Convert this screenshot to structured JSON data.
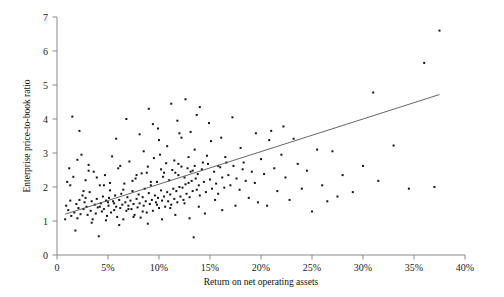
{
  "chart_data": {
    "type": "scatter",
    "title": "",
    "xlabel": "Return on net operating assets",
    "ylabel": "Enterprise price-to-book ratio",
    "xlim": [
      0,
      40
    ],
    "ylim": [
      0,
      7
    ],
    "grid": false,
    "legend": null,
    "xtick_labels": [
      "0",
      "5%",
      "10%",
      "15%",
      "20%",
      "25%",
      "30%",
      "35%",
      "40%"
    ],
    "xtick_values": [
      0,
      5,
      10,
      15,
      20,
      25,
      30,
      35,
      40
    ],
    "ytick_labels": [
      "0",
      "1",
      "2",
      "3",
      "4",
      "5",
      "6",
      "7"
    ],
    "ytick_values": [
      0,
      1,
      2,
      3,
      4,
      5,
      6,
      7
    ],
    "trendline": {
      "x0": 0.8,
      "y0": 1.2,
      "x1": 37.5,
      "y1": 4.72
    },
    "points": [
      [
        0.8,
        1.05
      ],
      [
        0.9,
        1.45
      ],
      [
        1.0,
        2.15
      ],
      [
        1.1,
        1.32
      ],
      [
        1.2,
        2.55
      ],
      [
        1.3,
        1.6
      ],
      [
        1.4,
        1.15
      ],
      [
        1.5,
        4.07
      ],
      [
        1.6,
        2.3
      ],
      [
        1.7,
        1.25
      ],
      [
        1.8,
        0.72
      ],
      [
        1.9,
        1.5
      ],
      [
        2.0,
        2.8
      ],
      [
        2.1,
        1.38
      ],
      [
        2.2,
        1.62
      ],
      [
        2.3,
        1.2
      ],
      [
        2.4,
        2.95
      ],
      [
        2.5,
        1.75
      ],
      [
        2.6,
        1.35
      ],
      [
        2.7,
        1.55
      ],
      [
        2.8,
        2.2
      ],
      [
        2.9,
        1.42
      ],
      [
        3.0,
        1.18
      ],
      [
        3.1,
        2.65
      ],
      [
        3.2,
        1.85
      ],
      [
        3.3,
        1.3
      ],
      [
        3.4,
        1.58
      ],
      [
        3.5,
        1.05
      ],
      [
        3.6,
        2.45
      ],
      [
        3.7,
        1.48
      ],
      [
        3.8,
        1.22
      ],
      [
        3.9,
        1.65
      ],
      [
        4.0,
        1.4
      ],
      [
        4.1,
        0.55
      ],
      [
        4.2,
        2.05
      ],
      [
        4.3,
        1.52
      ],
      [
        4.4,
        1.28
      ],
      [
        4.5,
        1.72
      ],
      [
        4.6,
        1.35
      ],
      [
        4.7,
        2.35
      ],
      [
        4.8,
        1.6
      ],
      [
        4.9,
        1.15
      ],
      [
        5.0,
        1.55
      ],
      [
        5.05,
        1.45
      ],
      [
        5.1,
        1.68
      ],
      [
        5.2,
        1.9
      ],
      [
        5.3,
        1.25
      ],
      [
        5.4,
        2.9
      ],
      [
        5.5,
        1.58
      ],
      [
        5.6,
        1.32
      ],
      [
        5.7,
        1.75
      ],
      [
        5.8,
        1.42
      ],
      [
        5.9,
        1.12
      ],
      [
        6.0,
        2.55
      ],
      [
        6.1,
        1.62
      ],
      [
        6.2,
        1.38
      ],
      [
        6.3,
        1.8
      ],
      [
        6.4,
        1.48
      ],
      [
        6.5,
        1.05
      ],
      [
        6.6,
        2.1
      ],
      [
        6.7,
        1.55
      ],
      [
        6.8,
        1.3
      ],
      [
        6.9,
        1.7
      ],
      [
        7.0,
        1.45
      ],
      [
        7.1,
        2.75
      ],
      [
        7.2,
        1.6
      ],
      [
        7.3,
        1.35
      ],
      [
        7.4,
        1.88
      ],
      [
        7.5,
        1.5
      ],
      [
        7.6,
        1.18
      ],
      [
        7.7,
        2.25
      ],
      [
        7.8,
        1.65
      ],
      [
        7.9,
        1.4
      ],
      [
        8.0,
        1.78
      ],
      [
        8.1,
        1.52
      ],
      [
        8.2,
        1.1
      ],
      [
        8.3,
        2.4
      ],
      [
        8.4,
        1.7
      ],
      [
        8.5,
        1.45
      ],
      [
        8.6,
        1.95
      ],
      [
        8.7,
        1.58
      ],
      [
        8.8,
        1.25
      ],
      [
        8.9,
        2.6
      ],
      [
        9.0,
        1.82
      ],
      [
        9.1,
        1.5
      ],
      [
        9.2,
        2.05
      ],
      [
        9.3,
        1.62
      ],
      [
        9.4,
        1.3
      ],
      [
        9.5,
        2.85
      ],
      [
        9.6,
        1.75
      ],
      [
        9.7,
        1.55
      ],
      [
        9.8,
        2.15
      ],
      [
        9.9,
        1.68
      ],
      [
        10.0,
        1.38
      ],
      [
        10.1,
        2.95
      ],
      [
        10.2,
        1.9
      ],
      [
        10.3,
        1.6
      ],
      [
        10.4,
        2.3
      ],
      [
        10.5,
        1.72
      ],
      [
        10.6,
        1.42
      ],
      [
        10.7,
        2.7
      ],
      [
        10.8,
        1.85
      ],
      [
        10.9,
        1.58
      ],
      [
        11.0,
        2.2
      ],
      [
        11.1,
        1.78
      ],
      [
        11.2,
        1.48
      ],
      [
        11.3,
        2.5
      ],
      [
        11.4,
        1.95
      ],
      [
        11.5,
        1.65
      ],
      [
        11.6,
        2.42
      ],
      [
        11.7,
        1.88
      ],
      [
        11.8,
        1.55
      ],
      [
        11.9,
        2.35
      ],
      [
        12.0,
        2.0
      ],
      [
        12.1,
        1.72
      ],
      [
        12.2,
        2.6
      ],
      [
        12.3,
        1.98
      ],
      [
        12.4,
        1.62
      ],
      [
        12.5,
        2.28
      ],
      [
        12.6,
        2.08
      ],
      [
        12.7,
        1.8
      ],
      [
        12.8,
        2.55
      ],
      [
        12.9,
        2.12
      ],
      [
        13.0,
        1.7
      ],
      [
        13.1,
        2.45
      ],
      [
        13.2,
        2.18
      ],
      [
        13.3,
        1.88
      ],
      [
        13.4,
        0.52
      ],
      [
        13.5,
        2.62
      ],
      [
        13.6,
        2.25
      ],
      [
        13.7,
        1.92
      ],
      [
        13.8,
        2.38
      ],
      [
        13.9,
        2.05
      ],
      [
        14.0,
        1.75
      ],
      [
        14.2,
        2.52
      ],
      [
        14.4,
        2.15
      ],
      [
        14.6,
        1.85
      ],
      [
        14.8,
        2.68
      ],
      [
        15.0,
        2.22
      ],
      [
        15.2,
        1.95
      ],
      [
        15.4,
        2.45
      ],
      [
        15.6,
        2.1
      ],
      [
        15.8,
        1.8
      ],
      [
        16.0,
        2.58
      ],
      [
        16.2,
        2.28
      ],
      [
        16.4,
        1.98
      ],
      [
        16.6,
        2.72
      ],
      [
        16.8,
        2.35
      ],
      [
        17.0,
        2.05
      ],
      [
        17.3,
        2.62
      ],
      [
        17.6,
        2.25
      ],
      [
        17.9,
        1.92
      ],
      [
        18.2,
        2.52
      ],
      [
        18.5,
        2.18
      ],
      [
        18.8,
        1.68
      ],
      [
        19.1,
        2.45
      ],
      [
        19.4,
        2.12
      ],
      [
        19.7,
        1.55
      ],
      [
        20.0,
        2.82
      ],
      [
        20.3,
        2.38
      ],
      [
        20.6,
        1.45
      ],
      [
        21.0,
        3.65
      ],
      [
        21.3,
        2.55
      ],
      [
        21.6,
        1.88
      ],
      [
        22.0,
        2.95
      ],
      [
        22.4,
        2.28
      ],
      [
        22.8,
        1.62
      ],
      [
        23.2,
        3.42
      ],
      [
        23.6,
        2.68
      ],
      [
        24.0,
        1.95
      ],
      [
        24.5,
        2.48
      ],
      [
        25.0,
        1.28
      ],
      [
        25.5,
        3.1
      ],
      [
        26.0,
        2.05
      ],
      [
        26.5,
        1.58
      ],
      [
        27.0,
        3.05
      ],
      [
        27.5,
        1.72
      ],
      [
        28.0,
        2.35
      ],
      [
        29.0,
        1.85
      ],
      [
        30.0,
        2.62
      ],
      [
        31.0,
        4.78
      ],
      [
        31.5,
        2.18
      ],
      [
        33.0,
        3.22
      ],
      [
        34.5,
        1.95
      ],
      [
        36.0,
        5.65
      ],
      [
        37.0,
        2.0
      ],
      [
        37.5,
        6.6
      ],
      [
        2.2,
        3.65
      ],
      [
        3.1,
        2.48
      ],
      [
        4.6,
        2.05
      ],
      [
        5.8,
        3.42
      ],
      [
        6.2,
        2.62
      ],
      [
        7.4,
        2.18
      ],
      [
        8.1,
        3.55
      ],
      [
        8.8,
        2.42
      ],
      [
        9.4,
        3.85
      ],
      [
        10.2,
        2.52
      ],
      [
        10.8,
        3.2
      ],
      [
        11.5,
        2.78
      ],
      [
        12.2,
        3.45
      ],
      [
        12.9,
        2.88
      ],
      [
        13.5,
        3.1
      ],
      [
        14.3,
        2.72
      ],
      [
        15.1,
        3.35
      ],
      [
        6.8,
        4.0
      ],
      [
        9.0,
        4.3
      ],
      [
        9.9,
        3.72
      ],
      [
        11.2,
        4.45
      ],
      [
        11.8,
        3.95
      ],
      [
        12.6,
        4.58
      ],
      [
        13.1,
        3.62
      ],
      [
        14.0,
        4.35
      ],
      [
        14.9,
        3.88
      ],
      [
        16.1,
        3.45
      ],
      [
        17.2,
        4.05
      ],
      [
        18.0,
        3.15
      ],
      [
        19.5,
        3.58
      ],
      [
        20.8,
        3.38
      ],
      [
        22.2,
        3.78
      ],
      [
        1.3,
        2.05
      ],
      [
        2.6,
        1.88
      ],
      [
        3.9,
        2.28
      ],
      [
        5.2,
        2.12
      ],
      [
        6.5,
        1.92
      ],
      [
        7.8,
        2.35
      ],
      [
        9.2,
        2.15
      ],
      [
        10.5,
        2.42
      ],
      [
        11.9,
        2.68
      ],
      [
        13.3,
        2.48
      ],
      [
        14.7,
        2.92
      ],
      [
        16.5,
        2.88
      ],
      [
        18.3,
        2.72
      ],
      [
        2.0,
        1.08
      ],
      [
        3.4,
        0.95
      ],
      [
        4.8,
        1.02
      ],
      [
        6.1,
        0.88
      ],
      [
        7.5,
        1.12
      ],
      [
        8.9,
        0.92
      ],
      [
        10.3,
        1.05
      ],
      [
        11.6,
        1.18
      ],
      [
        13.0,
        1.08
      ],
      [
        14.5,
        1.22
      ],
      [
        16.2,
        1.32
      ],
      [
        2.8,
        1.68
      ],
      [
        4.2,
        1.42
      ],
      [
        5.6,
        1.52
      ],
      [
        7.0,
        1.35
      ],
      [
        8.4,
        1.28
      ],
      [
        9.8,
        1.48
      ],
      [
        11.1,
        1.38
      ],
      [
        12.5,
        1.52
      ],
      [
        13.9,
        1.42
      ],
      [
        15.5,
        1.62
      ],
      [
        17.5,
        1.45
      ],
      [
        8.5,
        3.05
      ],
      [
        10.0,
        3.38
      ],
      [
        12.0,
        3.58
      ],
      [
        13.7,
        4.12
      ],
      [
        15.8,
        2.62
      ]
    ]
  }
}
